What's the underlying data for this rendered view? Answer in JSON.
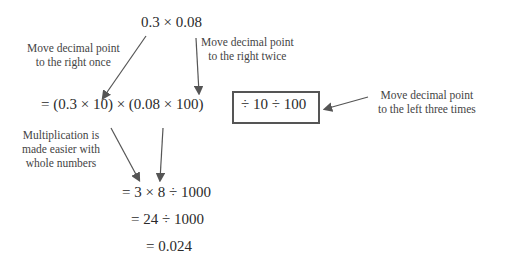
{
  "equations": {
    "top": "0.3 × 0.08",
    "line1_left": "= (0.3 × 10) × (0.08 × 100)",
    "line1_boxed": "÷ 10 ÷ 100",
    "line2": "= 3 × 8 ÷ 1000",
    "line3": "= 24 ÷ 1000",
    "line4": "= 0.024"
  },
  "annotations": {
    "right_once": [
      "Move decimal point",
      "to the right once"
    ],
    "right_twice": [
      "Move decimal point",
      "to the right twice"
    ],
    "left_three": [
      "Move decimal point",
      "to the left three times"
    ],
    "whole_numbers": [
      "Multiplication is",
      "made easier with",
      "whole numbers"
    ]
  },
  "colors": {
    "arrow": "#555555",
    "box": "#555555",
    "text": "#2a2a2a"
  }
}
